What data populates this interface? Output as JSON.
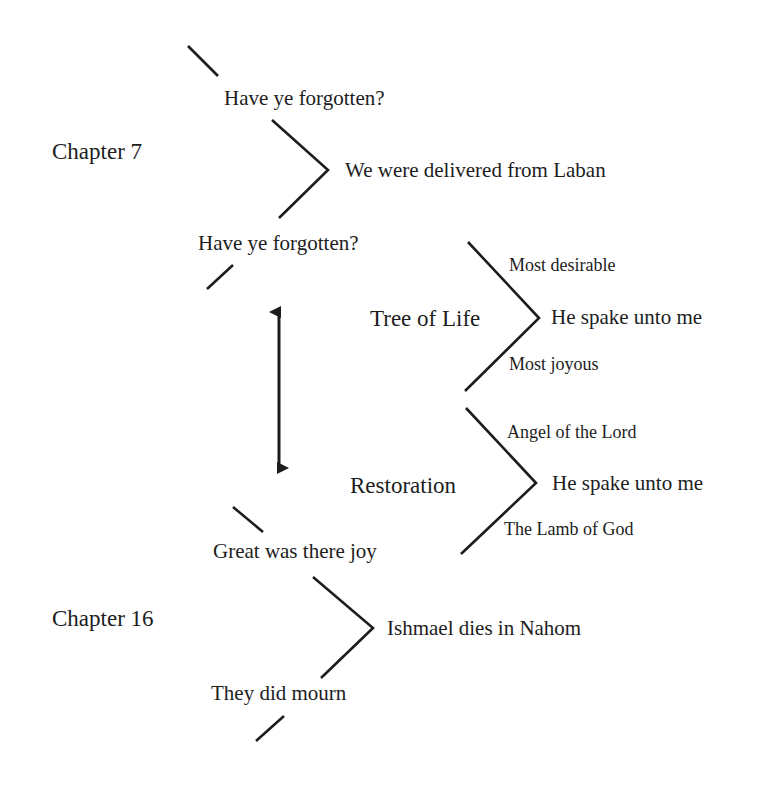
{
  "diagram": {
    "stroke_color": "#1d1d1d",
    "background_color": "#ffffff",
    "labels": {
      "chapter_7": "Chapter 7",
      "chapter_16": "Chapter 16",
      "have_ye_forgotten_top": "Have ye forgotten?",
      "we_were_delivered_from_laban": "We were delivered from Laban",
      "have_ye_forgotten_bottom": "Have ye forgotten?",
      "tree_of_life": "Tree of Life",
      "most_desirable": "Most desirable",
      "tree_he_spake_unto_me": "He spake unto me",
      "most_joyous": "Most joyous",
      "restoration": "Restoration",
      "angel_of_the_lord": "Angel of the Lord",
      "restoration_he_spake_unto_me": "He spake unto me",
      "the_lamb_of_god": "The Lamb of God",
      "great_was_there_joy": "Great was there joy",
      "ishmael_dies_in_nahom": "Ishmael dies in Nahom",
      "they_did_mourn": "They did mourn"
    },
    "connectors": {
      "stub_top": "diagonal-stub-top",
      "chevron_chapter_7": "chevron-chapter-7",
      "stub_upper_middle": "diagonal-stub-upper-middle",
      "chevron_tree_of_life": "chevron-tree-of-life",
      "chevron_restoration": "chevron-restoration",
      "stub_lower_middle": "diagonal-stub-lower-middle",
      "chevron_chapter_16": "chevron-chapter-16",
      "stub_bottom": "diagonal-stub-bottom",
      "double_arrow": "double-headed-vertical-arrow"
    }
  }
}
